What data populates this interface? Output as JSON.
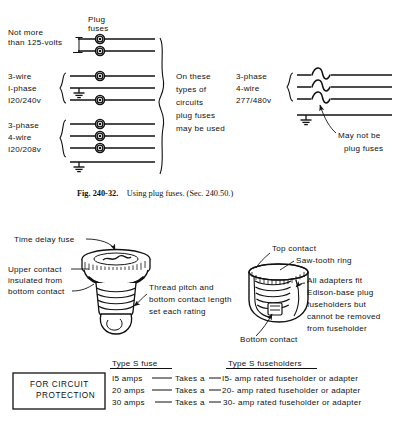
{
  "figure": {
    "caption_bold": "Fig. 240-32.",
    "caption_rest": "Using plug fuses. (Sec. 240.50.)"
  },
  "top_diagram": {
    "plug_fuses_label_line1": "Plug",
    "plug_fuses_label_line2": "fuses",
    "circuits": [
      {
        "name": "not-more-than-125-volts",
        "label_lines": [
          "Not more",
          "than 125-volts"
        ],
        "fuse_count": 2
      },
      {
        "name": "3-wire-1-phase-120-240v",
        "label_lines": [
          "3-wire",
          "I-phase",
          "I20/240v"
        ],
        "fuse_count": 2
      },
      {
        "name": "3-phase-4-wire-120-208v",
        "label_lines": [
          "3-phase",
          "4-wire",
          "I20/208v"
        ],
        "fuse_count": 3
      }
    ],
    "center_note_lines": [
      "On these",
      "types of",
      "circuits",
      "plug fuses",
      "may be used"
    ],
    "right_circuit": {
      "label_lines": [
        "3-phase",
        "4-wire",
        "277/480v"
      ],
      "callout_lines": [
        "May not be",
        "plug fuses"
      ]
    }
  },
  "bottom_diagram": {
    "left_fuse": {
      "callouts": [
        {
          "name": "time-delay-fuse",
          "lines": [
            "Time delay fuse"
          ]
        },
        {
          "name": "upper-contact-insulated",
          "lines": [
            "Upper contact",
            "insulated from",
            "bottom contact"
          ]
        },
        {
          "name": "thread-pitch",
          "lines": [
            "Thread pitch and",
            "bottom contact length",
            "set each rating"
          ]
        }
      ]
    },
    "right_fuseholder": {
      "callouts": [
        {
          "name": "top-contact",
          "lines": [
            "Top contact"
          ]
        },
        {
          "name": "saw-tooth-ring",
          "lines": [
            "Saw-tooth ring"
          ]
        },
        {
          "name": "all-adapters-fit",
          "lines": [
            "All adapters fit",
            "Edison-base plug",
            "fuseholders but",
            "cannot be removed",
            "from fuseholder"
          ]
        },
        {
          "name": "bottom-contact",
          "lines": [
            "Bottom contact"
          ]
        }
      ]
    }
  },
  "rating_table": {
    "box_lines": [
      "FOR CIRCUIT",
      "PROTECTION"
    ],
    "header_left": "Type S fuse",
    "header_right": "Type S fuseholders",
    "rows": [
      {
        "fuse": "I5 amps",
        "connector": "Takes a",
        "holder": "I5- amp rated fuseholder or adapter"
      },
      {
        "fuse": "20 amps",
        "connector": "Takes a",
        "holder": "20- amp rated fuseholder or adapter"
      },
      {
        "fuse": "30 amps",
        "connector": "Takes a",
        "holder": "30- amp rated fuseholder or adapter"
      }
    ]
  }
}
